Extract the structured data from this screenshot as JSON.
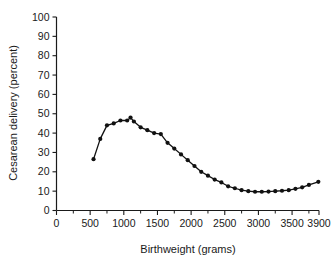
{
  "chart_data": {
    "type": "line",
    "title": "",
    "subtitle": "",
    "xlabel": "Birthweight (grams)",
    "ylabel": "Cesarean delivery (percent)",
    "xlim": [
      0,
      3900
    ],
    "ylim": [
      0,
      100
    ],
    "xticks": [
      0,
      500,
      1000,
      1500,
      2000,
      2500,
      3000,
      3500,
      3900
    ],
    "xtick_labels": [
      "0",
      "500",
      "1000",
      "1500",
      "2000",
      "2500",
      "3000",
      "3500",
      "3900"
    ],
    "yticks": [
      0,
      10,
      20,
      30,
      40,
      50,
      60,
      70,
      80,
      90,
      100
    ],
    "ytick_labels": [
      "0",
      "10",
      "20",
      "30",
      "40",
      "50",
      "60",
      "70",
      "80",
      "90",
      "100"
    ],
    "grid": false,
    "legend": false,
    "legend_position": "none",
    "marker": "filled-circle",
    "line_color": "#111111",
    "marker_color": "#111111",
    "background_color": "#ffffff",
    "x": [
      550,
      650,
      750,
      850,
      950,
      1050,
      1100,
      1150,
      1250,
      1350,
      1450,
      1550,
      1650,
      1750,
      1850,
      1950,
      2050,
      2150,
      2250,
      2350,
      2450,
      2550,
      2650,
      2750,
      2850,
      2950,
      3050,
      3150,
      3250,
      3350,
      3450,
      3550,
      3650,
      3750,
      3890
    ],
    "values": [
      26.5,
      37.0,
      44.0,
      45.0,
      46.5,
      46.5,
      48.0,
      46.0,
      43.0,
      41.5,
      40.0,
      39.5,
      35.0,
      32.0,
      29.0,
      26.0,
      23.0,
      20.0,
      18.0,
      16.0,
      14.5,
      12.5,
      11.5,
      10.5,
      10.0,
      9.7,
      9.7,
      9.8,
      10.0,
      10.2,
      10.5,
      11.2,
      12.0,
      13.2,
      14.8
    ],
    "series": [
      {
        "name": "Cesarean delivery rate",
        "values": [
          26.5,
          37.0,
          44.0,
          45.0,
          46.5,
          46.5,
          48.0,
          46.0,
          43.0,
          41.5,
          40.0,
          39.5,
          35.0,
          32.0,
          29.0,
          26.0,
          23.0,
          20.0,
          18.0,
          16.0,
          14.5,
          12.5,
          11.5,
          10.5,
          10.0,
          9.7,
          9.7,
          9.8,
          10.0,
          10.2,
          10.5,
          11.2,
          12.0,
          13.2,
          14.8
        ]
      }
    ],
    "annotations": []
  }
}
